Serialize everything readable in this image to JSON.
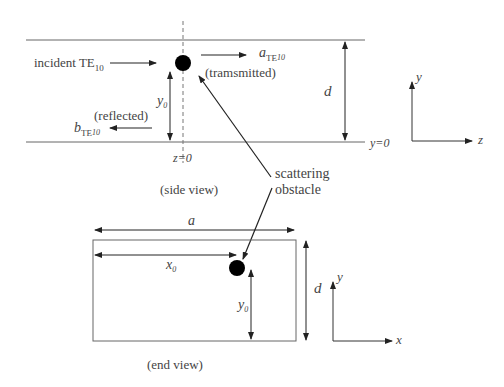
{
  "side_view": {
    "incident_label": "incident TE",
    "incident_sub": "10",
    "transmitted_symbol": "a",
    "transmitted_sub": "TE",
    "transmitted_subsub": "10",
    "transmitted_label": "(tramsmitted)",
    "reflected_label": "(reflected)",
    "reflected_symbol": "b",
    "reflected_sub": "TE",
    "reflected_subsub": "10",
    "y0_symbol": "y",
    "y0_sub": "0",
    "height_label": "d",
    "z0_label": "z=0",
    "y0_line_label": "y=0",
    "caption": "(side view)",
    "axes": {
      "vertical": "y",
      "horizontal": "z"
    }
  },
  "obstacle_label_line1": "scattering",
  "obstacle_label_line2": "obstacle",
  "end_view": {
    "width_label": "a",
    "x0_symbol": "x",
    "x0_sub": "0",
    "y0_symbol": "y",
    "y0_sub": "0",
    "height_label": "d",
    "caption": "(end view)",
    "axes": {
      "vertical": "y",
      "horizontal": "x"
    }
  },
  "colors": {
    "line": "#555555",
    "arrow": "#222222",
    "dot": "#000000",
    "dash": "#777777"
  }
}
